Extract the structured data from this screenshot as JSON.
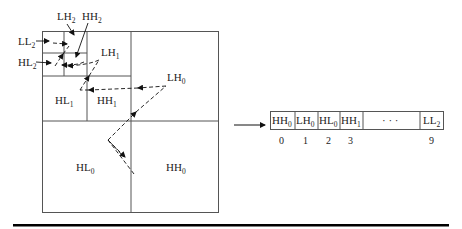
{
  "diagram": {
    "subbands": [
      {
        "id": "LL2",
        "base": "LL",
        "sub": "2"
      },
      {
        "id": "LH2",
        "base": "LH",
        "sub": "2"
      },
      {
        "id": "HH2",
        "base": "HH",
        "sub": "2"
      },
      {
        "id": "HL2",
        "base": "HL",
        "sub": "2"
      },
      {
        "id": "LH1",
        "base": "LH",
        "sub": "1"
      },
      {
        "id": "HL1",
        "base": "HL",
        "sub": "1"
      },
      {
        "id": "HH1",
        "base": "HH",
        "sub": "1"
      },
      {
        "id": "LH0",
        "base": "LH",
        "sub": "0"
      },
      {
        "id": "HL0",
        "base": "HL",
        "sub": "0"
      },
      {
        "id": "HH0",
        "base": "HH",
        "sub": "0"
      }
    ],
    "array": {
      "cells": [
        {
          "base": "HH",
          "sub": "0",
          "index": "0"
        },
        {
          "base": "LH",
          "sub": "0",
          "index": "1"
        },
        {
          "base": "HL",
          "sub": "0",
          "index": "2"
        },
        {
          "base": "HH",
          "sub": "1",
          "index": "3"
        },
        {
          "base": "",
          "sub": "",
          "ellipsis": "· · ·",
          "index": ""
        },
        {
          "base": "LL",
          "sub": "2",
          "index": "9"
        }
      ]
    },
    "colors": {
      "line": "#555555",
      "text": "#222222",
      "rule": "#000000"
    }
  }
}
